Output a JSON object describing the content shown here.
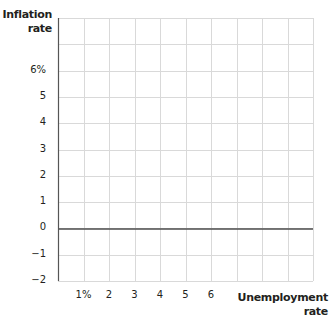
{
  "chart_data": {
    "type": "line",
    "title": "",
    "xlabel": "Unemployment rate",
    "ylabel": "Inflation rate",
    "xlabel_lines": [
      "Unemployment",
      "rate"
    ],
    "ylabel_lines": [
      "Inflation",
      "rate"
    ],
    "x_tick_labels": [
      "1%",
      "2",
      "3",
      "4",
      "5",
      "6"
    ],
    "x_tick_values": [
      1,
      2,
      3,
      4,
      5,
      6
    ],
    "y_tick_labels": [
      "6%",
      "5",
      "4",
      "3",
      "2",
      "1",
      "0",
      "−1",
      "−2"
    ],
    "y_tick_values": [
      6,
      5,
      4,
      3,
      2,
      1,
      0,
      -1,
      -2
    ],
    "xlim": [
      0,
      10
    ],
    "ylim": [
      -2,
      8
    ],
    "grid": true,
    "series": [],
    "reference_lines": [
      {
        "axis": "y",
        "value": 0,
        "label": "zero inflation baseline"
      }
    ],
    "legend": null
  },
  "colors": {
    "grid": "#d9d9d9",
    "axis": "#555555",
    "zero_line": "#4d4d4d",
    "text": "#231f20"
  }
}
